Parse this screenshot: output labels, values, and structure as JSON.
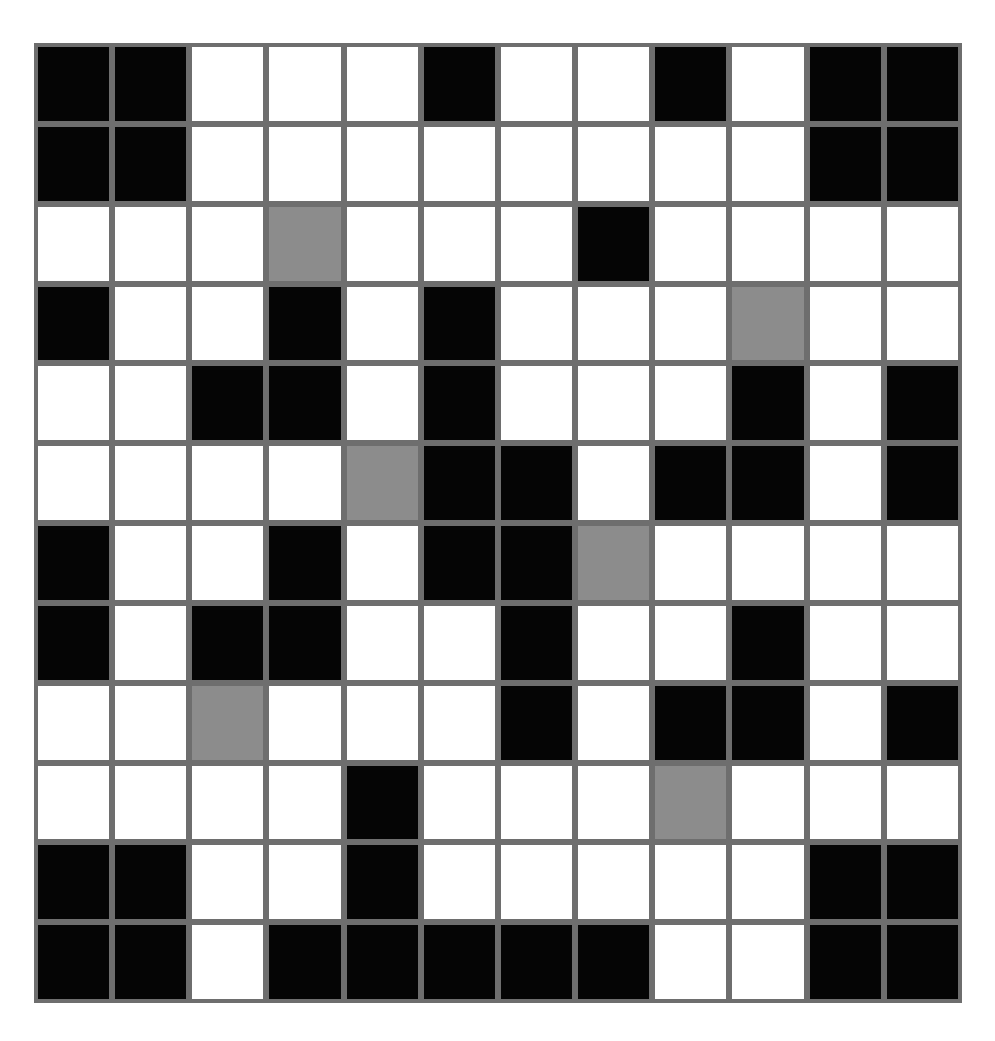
{
  "puzzle": {
    "rows": 12,
    "cols": 12,
    "legend": {
      "B": "black-cell",
      "W": "white-cell",
      "G": "gray-cell"
    },
    "colors": {
      "black": "#050505",
      "white": "#ffffff",
      "gray": "#8c8c8c",
      "grid_line": "#6e6e6e"
    },
    "grid": [
      [
        "B",
        "B",
        "W",
        "W",
        "W",
        "B",
        "W",
        "W",
        "B",
        "W",
        "B",
        "B"
      ],
      [
        "B",
        "B",
        "W",
        "W",
        "W",
        "W",
        "W",
        "W",
        "W",
        "W",
        "B",
        "B"
      ],
      [
        "W",
        "W",
        "W",
        "G",
        "W",
        "W",
        "W",
        "B",
        "W",
        "W",
        "W",
        "W"
      ],
      [
        "B",
        "W",
        "W",
        "B",
        "W",
        "B",
        "W",
        "W",
        "W",
        "G",
        "W",
        "W"
      ],
      [
        "W",
        "W",
        "B",
        "B",
        "W",
        "B",
        "W",
        "W",
        "W",
        "B",
        "W",
        "B"
      ],
      [
        "W",
        "W",
        "W",
        "W",
        "G",
        "B",
        "B",
        "W",
        "B",
        "B",
        "W",
        "B"
      ],
      [
        "B",
        "W",
        "W",
        "B",
        "W",
        "B",
        "B",
        "G",
        "W",
        "W",
        "W",
        "W"
      ],
      [
        "B",
        "W",
        "B",
        "B",
        "W",
        "W",
        "B",
        "W",
        "W",
        "B",
        "W",
        "W"
      ],
      [
        "W",
        "W",
        "G",
        "W",
        "W",
        "W",
        "B",
        "W",
        "B",
        "B",
        "W",
        "B"
      ],
      [
        "W",
        "W",
        "W",
        "W",
        "B",
        "W",
        "W",
        "W",
        "G",
        "W",
        "W",
        "W"
      ],
      [
        "B",
        "B",
        "W",
        "W",
        "B",
        "W",
        "W",
        "W",
        "W",
        "W",
        "B",
        "B"
      ],
      [
        "B",
        "B",
        "W",
        "B",
        "B",
        "B",
        "B",
        "B",
        "W",
        "W",
        "B",
        "B"
      ]
    ]
  }
}
